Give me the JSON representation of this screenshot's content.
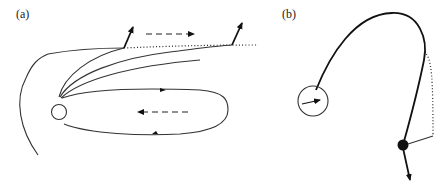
{
  "figure": {
    "panel_a": {
      "label": "(a)",
      "elements": [
        "body-circle",
        "field-lines",
        "closed-loop",
        "dotted-boundary",
        "outer-arc",
        "particle-escape-arrows",
        "flow-arrows"
      ]
    },
    "panel_b": {
      "label": "(b)",
      "elements": [
        "body-circle-with-vector",
        "curved-trajectory",
        "dotted-connector",
        "filled-particle",
        "velocity-arrow"
      ]
    },
    "colors": {
      "line": "#333333",
      "background": "#ffffff"
    }
  }
}
